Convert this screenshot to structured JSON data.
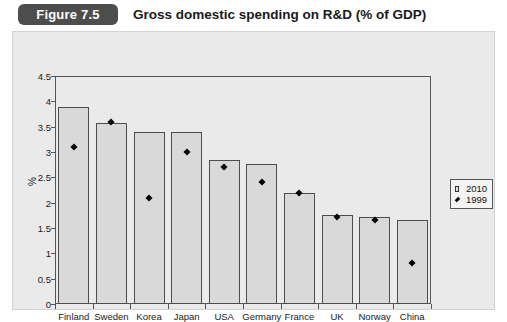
{
  "header": {
    "figure_badge": "Figure 7.5",
    "title": "Gross domestic spending on R&D (% of GDP)"
  },
  "legend": {
    "position": "right",
    "entries": [
      {
        "label": "2010",
        "marker": "square",
        "color": "#e2e2e2"
      },
      {
        "label": "1999",
        "marker": "diamond",
        "color": "#000000"
      }
    ]
  },
  "chart_data": {
    "type": "bar",
    "title": "Gross domestic spending on R&D (% of GDP)",
    "xlabel": "",
    "ylabel": "%",
    "ylim": [
      0,
      4.5
    ],
    "ytick_labels": [
      "0",
      "0.5",
      "1",
      "1.5",
      "2",
      "2.5",
      "3",
      "3.5",
      "4",
      "4.5"
    ],
    "ytick_values": [
      0,
      0.5,
      1,
      1.5,
      2,
      2.5,
      3,
      3.5,
      4,
      4.5
    ],
    "grid": false,
    "categories": [
      "Finland",
      "Sweden",
      "Korea",
      "Japan",
      "USA",
      "Germany",
      "France",
      "UK",
      "Norway",
      "China"
    ],
    "series": [
      {
        "name": "2010",
        "type": "bar",
        "values": [
          3.88,
          3.58,
          3.4,
          3.4,
          2.85,
          2.76,
          2.2,
          1.75,
          1.72,
          1.65
        ]
      },
      {
        "name": "1999",
        "type": "scatter",
        "values": [
          3.1,
          3.6,
          2.1,
          3.0,
          2.7,
          2.4,
          2.2,
          1.72,
          1.65,
          0.8
        ]
      }
    ]
  }
}
